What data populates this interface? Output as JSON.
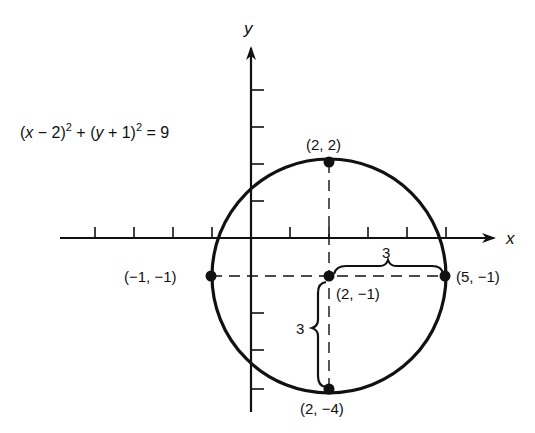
{
  "equation": {
    "part1": "(",
    "var_x": "x",
    "part2": " − 2)",
    "exp1": "2",
    "part3": " + (",
    "var_y": "y",
    "part4": " + 1)",
    "exp2": "2",
    "part5": " = 9"
  },
  "axes": {
    "x_label": "x",
    "y_label": "y"
  },
  "points": {
    "top": "(2, 2)",
    "center": "(2, −1)",
    "left": "(−1, −1)",
    "right": "(5, −1)",
    "bottom": "(2, −4)"
  },
  "radius_labels": {
    "horizontal": "3",
    "vertical": "3"
  },
  "colors": {
    "ink": "#111111",
    "background": "#ffffff"
  }
}
